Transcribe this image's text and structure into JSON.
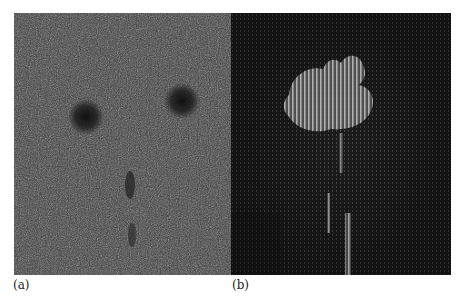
{
  "figure": {
    "panels": [
      {
        "id": "a",
        "label": "(a)",
        "description": "Noisy grayscale image with two dark circular spots and a faint dark vertical stem",
        "colors": {
          "background": "#3a3a3a",
          "spot": "#101010"
        }
      },
      {
        "id": "b",
        "label": "(b)",
        "description": "Dark vector-field visualization with a bright flower-shaped region and a vertical stem of bright vectors",
        "colors": {
          "background": "#1e1e1e",
          "highlight": "#9a9a9a"
        }
      }
    ]
  }
}
